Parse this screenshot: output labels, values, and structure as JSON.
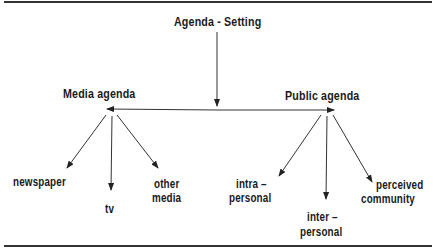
{
  "diagram": {
    "title": "Agenda - Setting",
    "nodes": {
      "media_agenda": "Media agenda",
      "public_agenda": "Public agenda"
    },
    "media_children": {
      "newspaper": "newspaper",
      "tv": "tv",
      "other_media_line1": "other",
      "other_media_line2": "media"
    },
    "public_children": {
      "intra_line1": "intra –",
      "intra_line2": "personal",
      "inter_line1": "inter –",
      "inter_line2": "personal",
      "perceived_line1": "perceived",
      "perceived_line2": "community"
    },
    "edges": [
      {
        "from": "Agenda - Setting",
        "to": "horizontal link"
      },
      {
        "from": "horizontal link",
        "to": "Media agenda"
      },
      {
        "from": "horizontal link",
        "to": "Public agenda"
      },
      {
        "from": "Media agenda",
        "to": "newspaper"
      },
      {
        "from": "Media agenda",
        "to": "tv"
      },
      {
        "from": "Media agenda",
        "to": "other media"
      },
      {
        "from": "Public agenda",
        "to": "intra-personal"
      },
      {
        "from": "Public agenda",
        "to": "inter-personal"
      },
      {
        "from": "Public agenda",
        "to": "perceived community"
      }
    ]
  }
}
